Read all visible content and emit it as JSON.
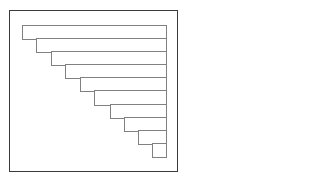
{
  "diagram": {
    "type": "staircase-bars",
    "frame": {
      "x": 9,
      "y": 10,
      "w": 169,
      "h": 162,
      "color": "#3a3a3a"
    },
    "bar_color": "#808080",
    "right_edge": 166,
    "bars": [
      {
        "left": 22,
        "top": 25,
        "bottom": 39
      },
      {
        "left": 36,
        "top": 38,
        "bottom": 52
      },
      {
        "left": 51,
        "top": 51,
        "bottom": 65
      },
      {
        "left": 65,
        "top": 64,
        "bottom": 78
      },
      {
        "left": 80,
        "top": 77,
        "bottom": 91
      },
      {
        "left": 94,
        "top": 90,
        "bottom": 105
      },
      {
        "left": 110,
        "top": 104,
        "bottom": 118
      },
      {
        "left": 124,
        "top": 117,
        "bottom": 131
      },
      {
        "left": 138,
        "top": 130,
        "bottom": 144
      },
      {
        "left": 152,
        "top": 143,
        "bottom": 157
      }
    ]
  }
}
